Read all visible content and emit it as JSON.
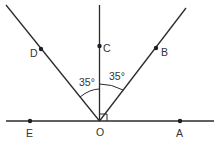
{
  "diagram": {
    "type": "geometry-angles",
    "vertex": "O",
    "points": {
      "O": {
        "label": "O",
        "x": 99.5,
        "y": 121
      },
      "A": {
        "label": "A",
        "x": 180,
        "y": 121
      },
      "E": {
        "label": "E",
        "x": 30,
        "y": 121
      },
      "C": {
        "label": "C",
        "x": 99.5,
        "y": 46
      },
      "B": {
        "label": "B",
        "x": 156,
        "y": 48
      },
      "D": {
        "label": "D",
        "x": 41,
        "y": 49
      }
    },
    "angles": [
      {
        "between": [
          "D",
          "O",
          "C"
        ],
        "label": "35°"
      },
      {
        "between": [
          "C",
          "O",
          "B"
        ],
        "label": "35°"
      },
      {
        "between": [
          "C",
          "O",
          "A"
        ],
        "label": "right-angle"
      }
    ],
    "angle_labels": {
      "left": "35°",
      "right": "35°"
    }
  }
}
